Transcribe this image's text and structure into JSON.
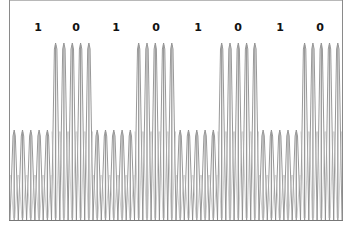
{
  "diagram": {
    "type": "amplitude-modulated waveform (ASK)",
    "bits": [
      "1",
      "0",
      "1",
      "0",
      "1",
      "0",
      "1",
      "0"
    ],
    "cycles_per_bit": 5,
    "x_start": 10,
    "bit_width": 41.5,
    "baseline_y": 220,
    "amplitude_top_y": {
      "1": 130,
      "0": 43
    },
    "label_x": [
      38,
      76,
      116,
      156,
      198,
      238,
      280,
      320
    ],
    "colors": {
      "waveform": "#8c8c8c",
      "frame": "#8a8a8a",
      "label": "#111111"
    }
  }
}
